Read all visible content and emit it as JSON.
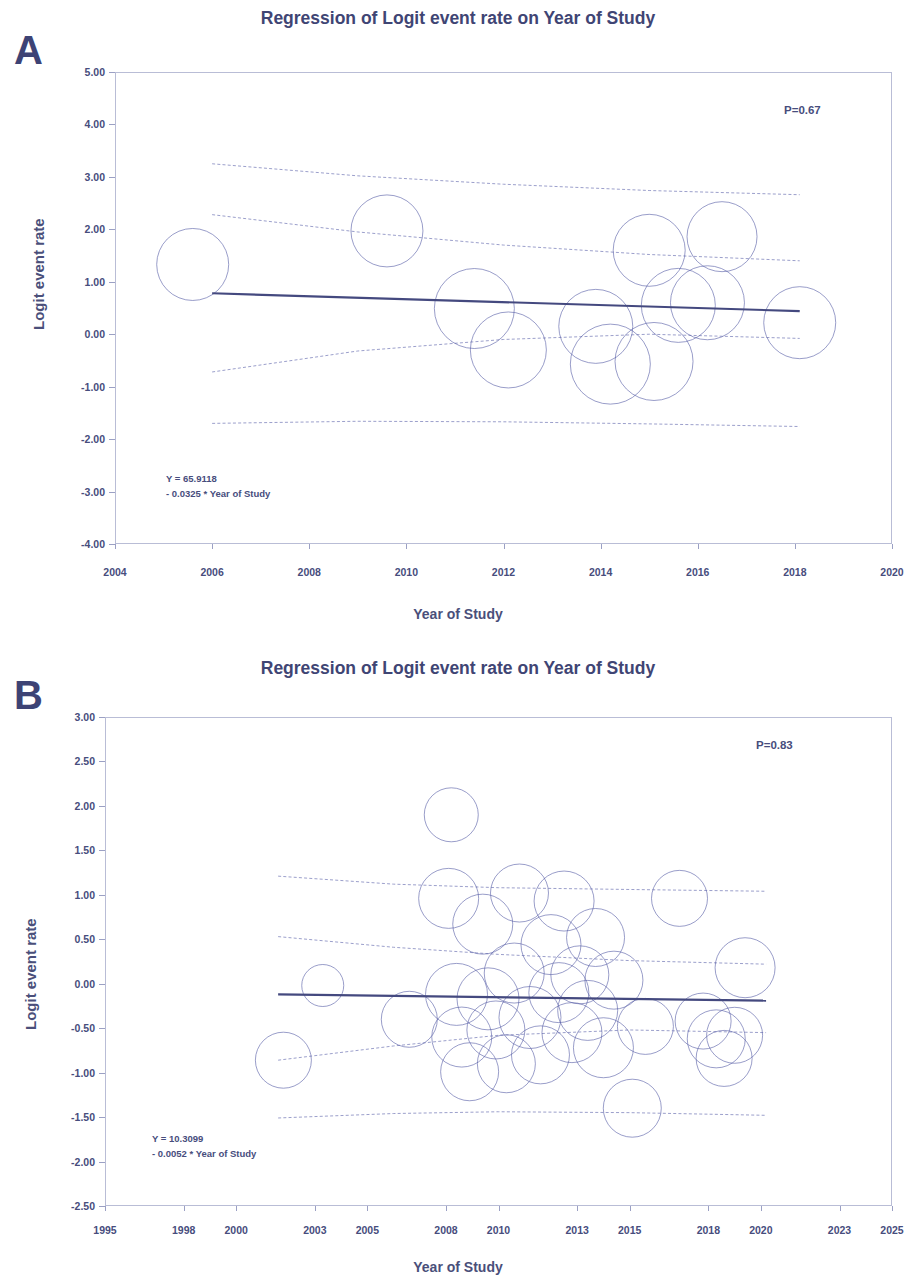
{
  "figure": {
    "panels": [
      {
        "letter": "A",
        "title": "Regression of Logit event rate on Year of Study",
        "pvalue_label": "P=0.67",
        "equation_line1": "Y = 65.9118",
        "equation_line2": "- 0.0325 * Year of Study",
        "xlabel": "Year of Study",
        "ylabel": "Logit event rate"
      },
      {
        "letter": "B",
        "title": "Regression of Logit event rate on Year of Study",
        "pvalue_label": "P=0.83",
        "equation_line1": "Y = 10.3099",
        "equation_line2": "- 0.0052 * Year of Study",
        "xlabel": "Year of Study",
        "ylabel": "Logit event rate"
      }
    ],
    "colors": {
      "axis": "#b9bdd6",
      "text": "#474d7d",
      "title": "#3f4574",
      "bubble_stroke": "#5b61a8",
      "regression_line": "#44497f",
      "ci_line": "#7b81bb"
    }
  },
  "chart_data": [
    {
      "id": "panel-a",
      "type": "scatter",
      "title": "Regression of Logit event rate on Year of Study",
      "xlabel": "Year of Study",
      "ylabel": "Logit event rate",
      "xlim": [
        2004,
        2020
      ],
      "ylim": [
        -4.0,
        5.0
      ],
      "xticks": [
        2004,
        2006,
        2008,
        2010,
        2012,
        2014,
        2016,
        2018,
        2020
      ],
      "xtick_labels": [
        "2004",
        "2006",
        "2008",
        "2010",
        "2012",
        "2014",
        "2016",
        "2018",
        "2020"
      ],
      "yticks": [
        5.0,
        4.0,
        3.0,
        2.0,
        1.0,
        0.0,
        -1.0,
        -2.0,
        -3.0,
        -4.0
      ],
      "ytick_labels": [
        "5.00",
        "4.00",
        "3.00",
        "2.00",
        "1.00",
        "0.00",
        "-1.00",
        "-2.00",
        "-3.00",
        "-4.00"
      ],
      "grid": false,
      "legend": "none",
      "annotations": [
        {
          "text": "P=0.67",
          "x": 2017.4,
          "y": 4.05
        },
        {
          "text": "Y = 65.9118",
          "x": 2005.1,
          "y": -2.9
        },
        {
          "text": "- 0.0325 * Year of Study",
          "x": 2005.1,
          "y": -3.15
        }
      ],
      "regression": {
        "intercept": 65.9118,
        "slope": -0.0325,
        "p_value": 0.67,
        "equation": "Y = 65.9118 - 0.0325 * Year of Study",
        "x_start": 2006.0,
        "x_end": 2018.1,
        "y_start": 0.78,
        "y_end": 0.44
      },
      "ci_upper": [
        {
          "x": 2006.0,
          "y": 3.25
        },
        {
          "x": 2009.0,
          "y": 3.02
        },
        {
          "x": 2012.0,
          "y": 2.86
        },
        {
          "x": 2015.0,
          "y": 2.74
        },
        {
          "x": 2018.1,
          "y": 2.66
        }
      ],
      "ci_lower": [
        {
          "x": 2006.0,
          "y": -1.7
        },
        {
          "x": 2009.0,
          "y": -1.66
        },
        {
          "x": 2012.0,
          "y": -1.67
        },
        {
          "x": 2015.0,
          "y": -1.71
        },
        {
          "x": 2018.1,
          "y": -1.76
        }
      ],
      "pi_upper": [
        {
          "x": 2006.0,
          "y": 2.28
        },
        {
          "x": 2009.0,
          "y": 1.95
        },
        {
          "x": 2012.0,
          "y": 1.7
        },
        {
          "x": 2015.0,
          "y": 1.52
        },
        {
          "x": 2018.1,
          "y": 1.4
        }
      ],
      "pi_lower": [
        {
          "x": 2006.0,
          "y": -0.72
        },
        {
          "x": 2009.0,
          "y": -0.32
        },
        {
          "x": 2012.0,
          "y": -0.1
        },
        {
          "x": 2015.0,
          "y": 0.0
        },
        {
          "x": 2018.1,
          "y": -0.08
        }
      ],
      "bubbles": [
        {
          "x": 2005.6,
          "y": 1.33,
          "r_px": 36
        },
        {
          "x": 2009.6,
          "y": 1.97,
          "r_px": 36
        },
        {
          "x": 2011.4,
          "y": 0.49,
          "r_px": 40
        },
        {
          "x": 2012.1,
          "y": -0.3,
          "r_px": 38
        },
        {
          "x": 2013.9,
          "y": 0.15,
          "r_px": 37
        },
        {
          "x": 2014.2,
          "y": -0.57,
          "r_px": 40
        },
        {
          "x": 2015.0,
          "y": 1.6,
          "r_px": 36
        },
        {
          "x": 2015.1,
          "y": -0.52,
          "r_px": 39
        },
        {
          "x": 2015.6,
          "y": 0.55,
          "r_px": 37
        },
        {
          "x": 2016.5,
          "y": 1.86,
          "r_px": 35
        },
        {
          "x": 2016.2,
          "y": 0.6,
          "r_px": 37
        },
        {
          "x": 2018.1,
          "y": 0.22,
          "r_px": 36
        }
      ]
    },
    {
      "id": "panel-b",
      "type": "scatter",
      "title": "Regression of Logit event rate on Year of Study",
      "xlabel": "Year of Study",
      "ylabel": "Logit event rate",
      "xlim": [
        1995,
        2025
      ],
      "ylim": [
        -2.5,
        3.0
      ],
      "xticks": [
        1995,
        1998,
        2000,
        2003,
        2005,
        2008,
        2010,
        2013,
        2015,
        2018,
        2020,
        2023,
        2025
      ],
      "xtick_labels": [
        "1995",
        "1998",
        "2000",
        "2003",
        "2005",
        "2008",
        "2010",
        "2013",
        "2015",
        "2018",
        "2020",
        "2023",
        "2025"
      ],
      "yticks": [
        3.0,
        2.5,
        2.0,
        1.5,
        1.0,
        0.5,
        0.0,
        -0.5,
        -1.0,
        -1.5,
        -2.0,
        -2.5
      ],
      "ytick_labels": [
        "3.00",
        "2.50",
        "2.00",
        "1.50",
        "1.00",
        "0.50",
        "0.00",
        "-0.50",
        "-1.00",
        "-1.50",
        "-2.00",
        "-2.50"
      ],
      "grid": false,
      "legend": "none",
      "annotations": [
        {
          "text": "P=0.83",
          "x": 2020.5,
          "y": 2.52
        },
        {
          "text": "Y = 10.3099",
          "x": 1999.0,
          "y": -1.83
        },
        {
          "text": "- 0.0052 * Year of Study",
          "x": 1999.0,
          "y": -1.99
        }
      ],
      "regression": {
        "intercept": 10.3099,
        "slope": -0.0052,
        "p_value": 0.83,
        "equation": "Y = 10.3099 - 0.0052 * Year of Study",
        "x_start": 2001.6,
        "x_end": 2020.2,
        "y_start": -0.12,
        "y_end": -0.19
      },
      "ci_upper": [
        {
          "x": 2001.6,
          "y": 1.21
        },
        {
          "x": 2006.0,
          "y": 1.12
        },
        {
          "x": 2010.0,
          "y": 1.08
        },
        {
          "x": 2015.0,
          "y": 1.06
        },
        {
          "x": 2020.2,
          "y": 1.04
        }
      ],
      "ci_lower": [
        {
          "x": 2001.6,
          "y": -1.51
        },
        {
          "x": 2006.0,
          "y": -1.46
        },
        {
          "x": 2010.0,
          "y": -1.44
        },
        {
          "x": 2015.0,
          "y": -1.45
        },
        {
          "x": 2020.2,
          "y": -1.48
        }
      ],
      "pi_upper": [
        {
          "x": 2001.6,
          "y": 0.53
        },
        {
          "x": 2006.0,
          "y": 0.41
        },
        {
          "x": 2010.0,
          "y": 0.33
        },
        {
          "x": 2015.0,
          "y": 0.26
        },
        {
          "x": 2020.2,
          "y": 0.22
        }
      ],
      "pi_lower": [
        {
          "x": 2001.6,
          "y": -0.86
        },
        {
          "x": 2006.0,
          "y": -0.7
        },
        {
          "x": 2010.0,
          "y": -0.58
        },
        {
          "x": 2015.0,
          "y": -0.52
        },
        {
          "x": 2020.2,
          "y": -0.55
        }
      ],
      "bubbles": [
        {
          "x": 2001.8,
          "y": -0.86,
          "r_px": 28
        },
        {
          "x": 2003.3,
          "y": -0.02,
          "r_px": 21
        },
        {
          "x": 2006.6,
          "y": -0.4,
          "r_px": 28
        },
        {
          "x": 2008.2,
          "y": 1.9,
          "r_px": 27
        },
        {
          "x": 2008.1,
          "y": 0.96,
          "r_px": 30
        },
        {
          "x": 2008.4,
          "y": -0.12,
          "r_px": 31
        },
        {
          "x": 2008.6,
          "y": -0.6,
          "r_px": 30
        },
        {
          "x": 2008.9,
          "y": -0.99,
          "r_px": 29
        },
        {
          "x": 2009.4,
          "y": 0.67,
          "r_px": 30
        },
        {
          "x": 2009.6,
          "y": -0.17,
          "r_px": 31
        },
        {
          "x": 2009.9,
          "y": -0.52,
          "r_px": 29
        },
        {
          "x": 2010.3,
          "y": -0.9,
          "r_px": 29
        },
        {
          "x": 2010.6,
          "y": 0.12,
          "r_px": 30
        },
        {
          "x": 2010.8,
          "y": 1.02,
          "r_px": 29
        },
        {
          "x": 2011.2,
          "y": -0.38,
          "r_px": 31
        },
        {
          "x": 2011.6,
          "y": -0.8,
          "r_px": 29
        },
        {
          "x": 2012.0,
          "y": 0.44,
          "r_px": 30
        },
        {
          "x": 2012.3,
          "y": -0.1,
          "r_px": 30
        },
        {
          "x": 2012.5,
          "y": 0.93,
          "r_px": 30
        },
        {
          "x": 2012.8,
          "y": -0.55,
          "r_px": 30
        },
        {
          "x": 2013.1,
          "y": 0.1,
          "r_px": 29
        },
        {
          "x": 2013.4,
          "y": -0.3,
          "r_px": 30
        },
        {
          "x": 2013.7,
          "y": 0.52,
          "r_px": 29
        },
        {
          "x": 2014.0,
          "y": -0.72,
          "r_px": 30
        },
        {
          "x": 2014.4,
          "y": 0.04,
          "r_px": 29
        },
        {
          "x": 2015.1,
          "y": -1.4,
          "r_px": 29
        },
        {
          "x": 2015.6,
          "y": -0.48,
          "r_px": 28
        },
        {
          "x": 2016.9,
          "y": 0.96,
          "r_px": 28
        },
        {
          "x": 2017.8,
          "y": -0.42,
          "r_px": 28
        },
        {
          "x": 2018.3,
          "y": -0.62,
          "r_px": 29
        },
        {
          "x": 2018.6,
          "y": -0.84,
          "r_px": 28
        },
        {
          "x": 2019.4,
          "y": 0.18,
          "r_px": 30
        },
        {
          "x": 2019.0,
          "y": -0.58,
          "r_px": 28
        }
      ]
    }
  ]
}
